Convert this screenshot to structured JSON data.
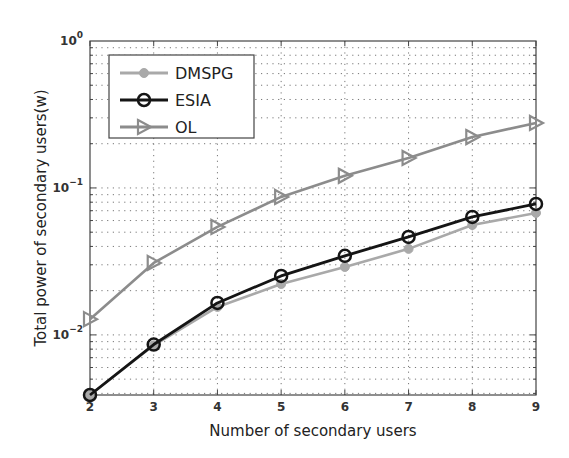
{
  "chart_data": {
    "type": "line",
    "title": "",
    "xlabel": "Number of secondary users",
    "ylabel": "Total power of secondary users(w)",
    "x": [
      2,
      3,
      4,
      5,
      6,
      7,
      8,
      9
    ],
    "xlim": [
      2,
      9
    ],
    "xticks": [
      "2",
      "3",
      "4",
      "5",
      "6",
      "7",
      "8",
      "9"
    ],
    "yscale": "log",
    "ylim": [
      0.0039,
      1
    ],
    "yticks": [
      {
        "value": 1,
        "base": "10",
        "exp": "0"
      },
      {
        "value": 0.1,
        "base": "10",
        "exp": "−1"
      },
      {
        "value": 0.01,
        "base": "10",
        "exp": "−2"
      }
    ],
    "grid": true,
    "legend_position": "upper left",
    "series": [
      {
        "name": "DMSPG",
        "marker": "circle-filled",
        "color": "#a9a9a9",
        "values": [
          0.0039,
          0.0085,
          0.0155,
          0.0222,
          0.029,
          0.0385,
          0.056,
          0.0676
        ]
      },
      {
        "name": "ESIA",
        "marker": "circle-open",
        "color": "#151515",
        "values": [
          0.0039,
          0.0086,
          0.0165,
          0.0252,
          0.0345,
          0.0464,
          0.0635,
          0.0778
        ]
      },
      {
        "name": "OL",
        "marker": "triangle-right",
        "color": "#8c8c8c",
        "values": [
          0.0128,
          0.0309,
          0.0543,
          0.0869,
          0.121,
          0.16,
          0.222,
          0.277
        ]
      }
    ]
  }
}
